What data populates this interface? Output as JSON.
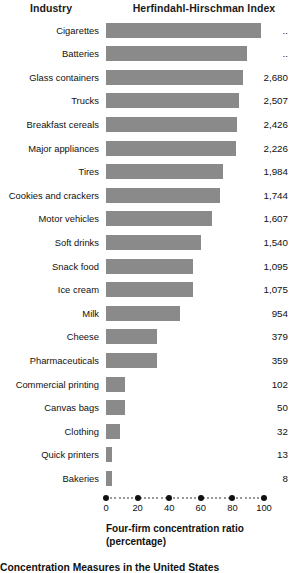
{
  "header": {
    "industry_label": "Industry",
    "hhi_label": "Herfindahl-Hirschman Index"
  },
  "axis": {
    "title_line1": "Four-firm concentration ratio",
    "title_line2": "(percentage)",
    "ticks": [
      0,
      20,
      40,
      60,
      80,
      100
    ],
    "tick_labels": [
      "0",
      "20",
      "40",
      "60",
      "80",
      "100"
    ],
    "min": 0,
    "max": 100
  },
  "caption": "Concentration Measures in the United States",
  "colors": {
    "bar": "#8a8a8a",
    "text": "#111111",
    "background": "#ffffff",
    "tick": "#111111",
    "dotted": "#777777"
  },
  "chart_data": {
    "type": "bar",
    "orientation": "horizontal",
    "title": "Concentration Measures in the United States",
    "xlabel": "Four-firm concentration ratio (percentage)",
    "ylabel": "Industry",
    "xlim": [
      0,
      100
    ],
    "grid": false,
    "legend": "none",
    "categories": [
      "Cigarettes",
      "Batteries",
      "Glass containers",
      "Trucks",
      "Breakfast cereals",
      "Major appliances",
      "Tires",
      "Cookies and crackers",
      "Motor vehicles",
      "Soft drinks",
      "Snack food",
      "Ice cream",
      "Milk",
      "Cheese",
      "Pharmaceuticals",
      "Commercial printing",
      "Canvas bags",
      "Clothing",
      "Quick printers",
      "Bakeries"
    ],
    "series": [
      {
        "name": "Four-firm concentration ratio (percentage)",
        "values": [
          98,
          89,
          87,
          84,
          83,
          82,
          74,
          72,
          67,
          60,
          55,
          55,
          47,
          32,
          32,
          12,
          12,
          9,
          4,
          4
        ]
      }
    ],
    "annotations": {
      "name": "Herfindahl-Hirschman Index",
      "values": [
        "..",
        "..",
        "2,680",
        "2,507",
        "2,426",
        "2,226",
        "1,984",
        "1,744",
        "1,607",
        "1,540",
        "1,095",
        "1,075",
        "954",
        "379",
        "359",
        "102",
        "50",
        "32",
        "13",
        "8"
      ]
    }
  },
  "rows": [
    {
      "industry": "Cigarettes",
      "ratio": 98,
      "hhi": ".."
    },
    {
      "industry": "Batteries",
      "ratio": 89,
      "hhi": ".."
    },
    {
      "industry": "Glass containers",
      "ratio": 87,
      "hhi": "2,680"
    },
    {
      "industry": "Trucks",
      "ratio": 84,
      "hhi": "2,507"
    },
    {
      "industry": "Breakfast cereals",
      "ratio": 83,
      "hhi": "2,426"
    },
    {
      "industry": "Major appliances",
      "ratio": 82,
      "hhi": "2,226"
    },
    {
      "industry": "Tires",
      "ratio": 74,
      "hhi": "1,984"
    },
    {
      "industry": "Cookies and crackers",
      "ratio": 72,
      "hhi": "1,744"
    },
    {
      "industry": "Motor vehicles",
      "ratio": 67,
      "hhi": "1,607"
    },
    {
      "industry": "Soft drinks",
      "ratio": 60,
      "hhi": "1,540"
    },
    {
      "industry": "Snack food",
      "ratio": 55,
      "hhi": "1,095"
    },
    {
      "industry": "Ice cream",
      "ratio": 55,
      "hhi": "1,075"
    },
    {
      "industry": "Milk",
      "ratio": 47,
      "hhi": "954"
    },
    {
      "industry": "Cheese",
      "ratio": 32,
      "hhi": "379"
    },
    {
      "industry": "Pharmaceuticals",
      "ratio": 32,
      "hhi": "359"
    },
    {
      "industry": "Commercial printing",
      "ratio": 12,
      "hhi": "102"
    },
    {
      "industry": "Canvas bags",
      "ratio": 12,
      "hhi": "50"
    },
    {
      "industry": "Clothing",
      "ratio": 9,
      "hhi": "32"
    },
    {
      "industry": "Quick printers",
      "ratio": 4,
      "hhi": "13"
    },
    {
      "industry": "Bakeries",
      "ratio": 4,
      "hhi": "8"
    }
  ]
}
